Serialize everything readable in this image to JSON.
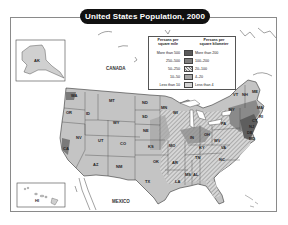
{
  "title": "United States Population, 2000",
  "legend": {
    "left_header": "Persons per square mile",
    "right_header": "Persons per square kilometer",
    "rows": [
      {
        "mile": "More than 500",
        "km": "More than 200",
        "color": "#5a5a5a",
        "pattern": "solid"
      },
      {
        "mile": "250–500",
        "km": "100–200",
        "color": "#7d7d7d",
        "pattern": "solid"
      },
      {
        "mile": "50–250",
        "km": "20–100",
        "color": "#cfcfcf",
        "pattern": "hatch"
      },
      {
        "mile": "10–50",
        "km": "4–20",
        "color": "#a6a6a6",
        "pattern": "solid"
      },
      {
        "mile": "Less than 10",
        "km": "Less than 4",
        "color": "#d4d4d4",
        "pattern": "solid"
      }
    ]
  },
  "countries": {
    "canada": "CANADA",
    "mexico": "MEXICO"
  },
  "states": [
    {
      "abbr": "AK",
      "x": 37,
      "y": 61
    },
    {
      "abbr": "HI",
      "x": 38,
      "y": 201
    },
    {
      "abbr": "WA",
      "x": 74,
      "y": 96
    },
    {
      "abbr": "OR",
      "x": 69,
      "y": 113
    },
    {
      "abbr": "ID",
      "x": 89,
      "y": 114
    },
    {
      "abbr": "MT",
      "x": 112,
      "y": 101
    },
    {
      "abbr": "WY",
      "x": 116,
      "y": 123
    },
    {
      "abbr": "NV",
      "x": 79,
      "y": 138
    },
    {
      "abbr": "UT",
      "x": 101,
      "y": 141
    },
    {
      "abbr": "CO",
      "x": 123,
      "y": 144
    },
    {
      "abbr": "CA",
      "x": 66,
      "y": 149
    },
    {
      "abbr": "AZ",
      "x": 96,
      "y": 165
    },
    {
      "abbr": "NM",
      "x": 119,
      "y": 167
    },
    {
      "abbr": "ND",
      "x": 145,
      "y": 103
    },
    {
      "abbr": "SD",
      "x": 145,
      "y": 117
    },
    {
      "abbr": "NE",
      "x": 146,
      "y": 131
    },
    {
      "abbr": "KS",
      "x": 151,
      "y": 147
    },
    {
      "abbr": "OK",
      "x": 156,
      "y": 162
    },
    {
      "abbr": "TX",
      "x": 148,
      "y": 182
    },
    {
      "abbr": "MN",
      "x": 164,
      "y": 108
    },
    {
      "abbr": "WI",
      "x": 176,
      "y": 113
    },
    {
      "abbr": "MO",
      "x": 172,
      "y": 146
    },
    {
      "abbr": "AR",
      "x": 175,
      "y": 163
    },
    {
      "abbr": "LA",
      "x": 178,
      "y": 182
    },
    {
      "abbr": "MS",
      "x": 188,
      "y": 175
    },
    {
      "abbr": "AL",
      "x": 196,
      "y": 175
    },
    {
      "abbr": "TN",
      "x": 198,
      "y": 158
    },
    {
      "abbr": "KY",
      "x": 202,
      "y": 148
    },
    {
      "abbr": "IN",
      "x": 193,
      "y": 138
    },
    {
      "abbr": "OH",
      "x": 207,
      "y": 135
    },
    {
      "abbr": "WV",
      "x": 217,
      "y": 141
    },
    {
      "abbr": "VA",
      "x": 224,
      "y": 148
    },
    {
      "abbr": "NC",
      "x": 222,
      "y": 160
    },
    {
      "abbr": "PA",
      "x": 224,
      "y": 124
    },
    {
      "abbr": "NY",
      "x": 232,
      "y": 110
    },
    {
      "abbr": "VT",
      "x": 236,
      "y": 95
    },
    {
      "abbr": "NH",
      "x": 245,
      "y": 95
    },
    {
      "abbr": "ME",
      "x": 255,
      "y": 92
    },
    {
      "abbr": "MA",
      "x": 260,
      "y": 108
    },
    {
      "abbr": "RI",
      "x": 262,
      "y": 117
    },
    {
      "abbr": "CT",
      "x": 255,
      "y": 121
    },
    {
      "abbr": "NJ",
      "x": 252,
      "y": 127
    },
    {
      "abbr": "DE",
      "x": 250,
      "y": 133
    },
    {
      "abbr": "MD",
      "x": 252,
      "y": 139
    }
  ]
}
